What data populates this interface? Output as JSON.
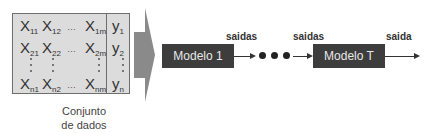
{
  "dataset": {
    "rows": [
      {
        "x": [
          [
            "X",
            "11"
          ],
          [
            "X",
            "12"
          ],
          [
            "…",
            ""
          ],
          [
            "X",
            "1m"
          ]
        ],
        "y": [
          "y",
          "1"
        ]
      },
      {
        "x": [
          [
            "X",
            "21"
          ],
          [
            "X",
            "22"
          ],
          [
            "…",
            ""
          ],
          [
            "X",
            "2m"
          ]
        ],
        "y": [
          "y",
          "2"
        ]
      },
      {
        "x": [
          [
            "X",
            "n1"
          ],
          [
            "X",
            "n2"
          ],
          [
            "…",
            ""
          ],
          [
            "X",
            "nm"
          ]
        ],
        "y": [
          "y",
          "n"
        ]
      }
    ],
    "caption_line1": "Conjunto",
    "caption_line2": "de dados"
  },
  "colors": {
    "matrix_fill": "#dcdcdc",
    "arrow_fill": "#8a8a8a",
    "model_fill": "#3d3d3d",
    "model_text": "#e8e8e8"
  },
  "pipeline": {
    "model_first": "Modelo 1",
    "model_last": "Modelo T",
    "label_out1": "saidas",
    "label_out2": "saidas",
    "label_final": "saida"
  }
}
